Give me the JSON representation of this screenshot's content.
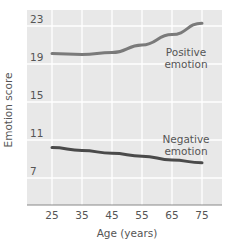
{
  "chart_data": {
    "type": "line",
    "title": "",
    "xlabel": "Age (years)",
    "ylabel": "Emotion score",
    "x": [
      25,
      35,
      45,
      55,
      65,
      75
    ],
    "x_ticks": [
      "25",
      "35",
      "45",
      "55",
      "65",
      "75"
    ],
    "y_ticks": [
      "23",
      "19",
      "15",
      "11",
      "7"
    ],
    "y_tick_values": [
      23,
      19,
      15,
      11,
      7
    ],
    "ylim": [
      4.1,
      23.9
    ],
    "xlim": [
      17,
      83.5
    ],
    "grid": true,
    "legend": "inline annotations",
    "series": [
      {
        "name": "Positive emotion",
        "label_line1": "Positive",
        "label_line2": "emotion",
        "values": [
          20.1,
          20.0,
          20.2,
          21.0,
          22.1,
          23.3
        ],
        "color": "#7a7a7a"
      },
      {
        "name": "Negative emotion",
        "label_line1": "Negative",
        "label_line2": "emotion",
        "values": [
          10.2,
          9.9,
          9.6,
          9.3,
          8.9,
          8.6
        ],
        "color": "#4a4a4a"
      }
    ]
  },
  "style": {
    "plot_background": "#e8e8e8",
    "gridline_color": "#ffffff",
    "axis_color": "#888888",
    "text_color": "#555555"
  }
}
